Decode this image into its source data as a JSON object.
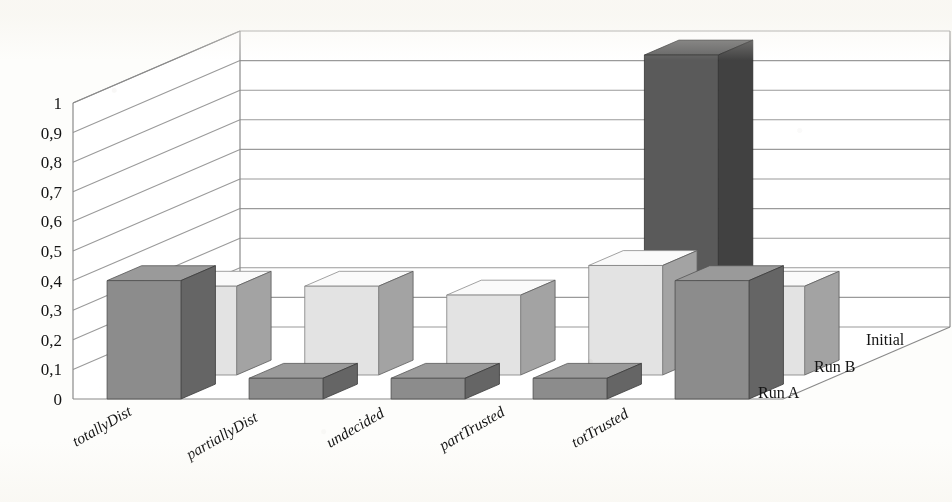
{
  "chart_data": {
    "type": "bar",
    "subtype": "3d-clustered-column",
    "title": "",
    "subtitle": "",
    "xlabel": "",
    "ylabel": "",
    "zlabel": "",
    "categories": [
      "totallyDist",
      "partiallyDist",
      "undecided",
      "partTrusted",
      "totTrusted"
    ],
    "series": [
      {
        "name": "Run A",
        "color": "#8c8c8c",
        "values": [
          0.4,
          0.07,
          0.07,
          0.07,
          0.4
        ]
      },
      {
        "name": "Run B",
        "color": "#e3e3e3",
        "values": [
          0.3,
          0.3,
          0.27,
          0.37,
          0.3
        ]
      },
      {
        "name": "Initial",
        "color": "#5a5a5a",
        "values": [
          0.0,
          0.0,
          0.0,
          1.0,
          0.0
        ]
      }
    ],
    "ylim": [
      0,
      1
    ],
    "ystep": 0.1,
    "ytick_labels": [
      "0",
      "0,1",
      "0,2",
      "0,3",
      "0,4",
      "0,5",
      "0,6",
      "0,7",
      "0,8",
      "0,9",
      "1"
    ],
    "ytick_values": [
      0,
      0.1,
      0.2,
      0.3,
      0.4,
      0.5,
      0.6,
      0.7,
      0.8,
      0.9,
      1
    ],
    "decimal_separator": ",",
    "grid": true,
    "grid_axis": "y",
    "legend": "none",
    "series_labels_position": "depth-axis-right",
    "category_label_rotation": -30,
    "background": "#fdfdfb",
    "grid_color": "#9a9a9a",
    "frame_color": "#8a8a8a"
  },
  "chart": {
    "ytick_labels": [
      "1",
      "0,9",
      "0,8",
      "0,7",
      "0,6",
      "0,5",
      "0,4",
      "0,3",
      "0,2",
      "0,1",
      "0"
    ],
    "categories": [
      "totallyDist",
      "partiallyDist",
      "undecided",
      "partTrusted",
      "totTrusted"
    ],
    "series_names": [
      "Run A",
      "Run B",
      "Initial"
    ]
  }
}
